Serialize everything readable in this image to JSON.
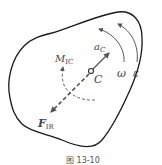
{
  "figure": {
    "caption": "图 13-10",
    "center_label": "C",
    "labels": {
      "acceleration": {
        "symbol": "a",
        "subscript": "C"
      },
      "inertia_moment": {
        "symbol": "M",
        "subscript": "IC"
      },
      "inertia_force": {
        "symbol": "F",
        "subscript": "IR"
      },
      "angular_velocity": {
        "symbol": "ω"
      },
      "angular_acceleration": {
        "symbol": "ε"
      }
    },
    "colors": {
      "outline": "#1a1a1a",
      "arrows": "#555555",
      "text": "#444444"
    }
  }
}
